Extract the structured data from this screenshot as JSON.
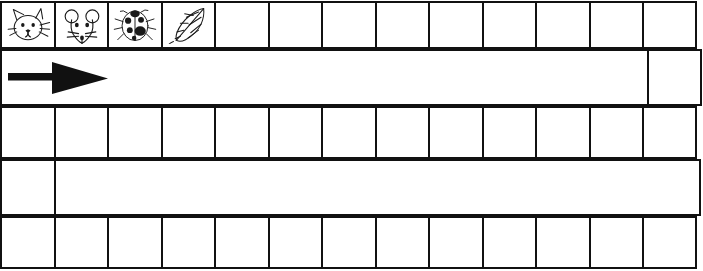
{
  "worksheet": {
    "title": "Picture pattern tracing grid",
    "background_color": "#ffffff",
    "line_color": "#111111",
    "columns": 13,
    "rows": 5
  },
  "rows": [
    {
      "name": "row-pictures",
      "kind": "cells",
      "cells": [
        {
          "icon": "cat-face-icon",
          "label": "cat"
        },
        {
          "icon": "mouse-face-icon",
          "label": "mouse"
        },
        {
          "icon": "ladybug-icon",
          "label": "ladybug"
        },
        {
          "icon": "leaf-icon",
          "label": "leaf"
        },
        {
          "icon": "",
          "label": ""
        },
        {
          "icon": "",
          "label": ""
        },
        {
          "icon": "",
          "label": ""
        },
        {
          "icon": "",
          "label": ""
        },
        {
          "icon": "",
          "label": ""
        },
        {
          "icon": "",
          "label": ""
        },
        {
          "icon": "",
          "label": ""
        },
        {
          "icon": "",
          "label": ""
        },
        {
          "icon": "",
          "label": ""
        }
      ]
    },
    {
      "name": "row-arrow",
      "kind": "strip",
      "cells": [
        {
          "icon": "right-arrow-icon",
          "label": ""
        },
        {
          "icon": "",
          "label": ""
        }
      ]
    },
    {
      "name": "row-blank-1",
      "kind": "cells",
      "cells": [
        {
          "icon": "",
          "label": ""
        },
        {
          "icon": "",
          "label": ""
        },
        {
          "icon": "",
          "label": ""
        },
        {
          "icon": "",
          "label": ""
        },
        {
          "icon": "",
          "label": ""
        },
        {
          "icon": "",
          "label": ""
        },
        {
          "icon": "",
          "label": ""
        },
        {
          "icon": "",
          "label": ""
        },
        {
          "icon": "",
          "label": ""
        },
        {
          "icon": "",
          "label": ""
        },
        {
          "icon": "",
          "label": ""
        },
        {
          "icon": "",
          "label": ""
        },
        {
          "icon": "",
          "label": ""
        }
      ]
    },
    {
      "name": "row-wide",
      "kind": "strip-left",
      "cells": [
        {
          "icon": "",
          "label": ""
        },
        {
          "icon": "",
          "label": ""
        }
      ]
    },
    {
      "name": "row-blank-2",
      "kind": "cells",
      "cells": [
        {
          "icon": "",
          "label": ""
        },
        {
          "icon": "",
          "label": ""
        },
        {
          "icon": "",
          "label": ""
        },
        {
          "icon": "",
          "label": ""
        },
        {
          "icon": "",
          "label": ""
        },
        {
          "icon": "",
          "label": ""
        },
        {
          "icon": "",
          "label": ""
        },
        {
          "icon": "",
          "label": ""
        },
        {
          "icon": "",
          "label": ""
        },
        {
          "icon": "",
          "label": ""
        },
        {
          "icon": "",
          "label": ""
        },
        {
          "icon": "",
          "label": ""
        },
        {
          "icon": "",
          "label": ""
        }
      ]
    }
  ]
}
